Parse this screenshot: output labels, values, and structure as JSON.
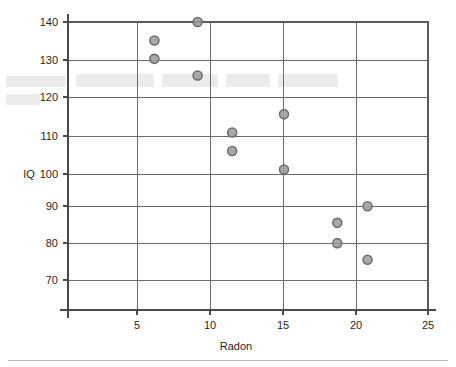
{
  "chart_data": {
    "type": "scatter",
    "title": "",
    "xlabel": "Radon",
    "ylabel": "IQ",
    "xlim": [
      0,
      25
    ],
    "ylim": [
      62,
      142
    ],
    "xticks": [
      5,
      10,
      15,
      20,
      25
    ],
    "yticks": [
      70,
      80,
      90,
      100,
      110,
      120,
      130,
      140
    ],
    "xtick_labels": [
      "5",
      "10",
      "15",
      "20",
      "25"
    ],
    "ytick_labels": [
      "70",
      "80",
      "90",
      "100",
      "110",
      "120",
      "130",
      "140"
    ],
    "grid": "both-axes-at-ticks",
    "legend": "none",
    "marker": {
      "shape": "circle-open",
      "fill_color": "#9a9a9a",
      "edge_color": "#6f6f6f",
      "size_px": 9
    },
    "series": [
      {
        "name": "Radon vs IQ",
        "points": [
          {
            "x": 9.0,
            "y": 140
          },
          {
            "x": 6.0,
            "y": 135
          },
          {
            "x": 6.0,
            "y": 130
          },
          {
            "x": 9.0,
            "y": 125.5
          },
          {
            "x": 15.0,
            "y": 115
          },
          {
            "x": 11.4,
            "y": 110
          },
          {
            "x": 11.4,
            "y": 105
          },
          {
            "x": 15.0,
            "y": 100
          },
          {
            "x": 20.8,
            "y": 90
          },
          {
            "x": 18.7,
            "y": 85.5
          },
          {
            "x": 18.7,
            "y": 80
          },
          {
            "x": 20.8,
            "y": 75.5
          }
        ]
      }
    ],
    "n_points": 12,
    "relationship": "negative association between radon level and IQ"
  },
  "axes": {
    "y_axis_title": "IQ",
    "x_axis_title": "Radon"
  },
  "colors": {
    "grid": "#6b6b6b",
    "frame": "#5a5a5a",
    "marker_fill": "#9a9a9a",
    "marker_edge": "#6f6f6f",
    "text": "#1f1f1f",
    "background": "#ffffff",
    "footer_rule": "#b8b8b8"
  }
}
